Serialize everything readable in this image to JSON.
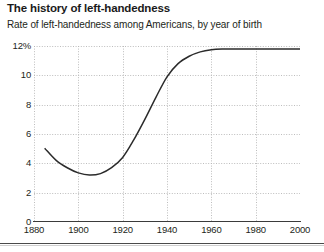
{
  "header": {
    "title": "The history of left-handedness",
    "subtitle": "Rate of left-handedness among Americans, by year of birth"
  },
  "chart_data": {
    "type": "line",
    "title": "The history of left-handedness",
    "subtitle": "Rate of left-handedness among Americans, by year of birth",
    "xlabel": "",
    "ylabel": "",
    "xlim": [
      1880,
      2000
    ],
    "ylim": [
      0,
      12
    ],
    "grid": true,
    "legend": null,
    "y_ticks": [
      0,
      2,
      4,
      6,
      8,
      10,
      12
    ],
    "y_tick_labels": [
      "0",
      "2",
      "4",
      "6",
      "8",
      "10",
      "12%"
    ],
    "x_ticks": [
      1880,
      1900,
      1920,
      1940,
      1960,
      1980,
      2000
    ],
    "x_tick_labels": [
      "1880",
      "1900",
      "1920",
      "1940",
      "1960",
      "1980",
      "2000"
    ],
    "series": [
      {
        "name": "Rate of left-handedness",
        "color": "#2b2b2b",
        "x": [
          1885,
          1890,
          1895,
          1900,
          1905,
          1910,
          1915,
          1920,
          1925,
          1930,
          1935,
          1940,
          1945,
          1950,
          1955,
          1960,
          1965,
          1970,
          1975,
          1980,
          1985,
          1990,
          1995,
          2000
        ],
        "y": [
          5.0,
          4.2,
          3.7,
          3.35,
          3.2,
          3.3,
          3.7,
          4.4,
          5.6,
          7.0,
          8.5,
          9.9,
          10.8,
          11.3,
          11.6,
          11.75,
          11.8,
          11.8,
          11.8,
          11.8,
          11.8,
          11.8,
          11.8,
          11.8
        ]
      }
    ]
  }
}
